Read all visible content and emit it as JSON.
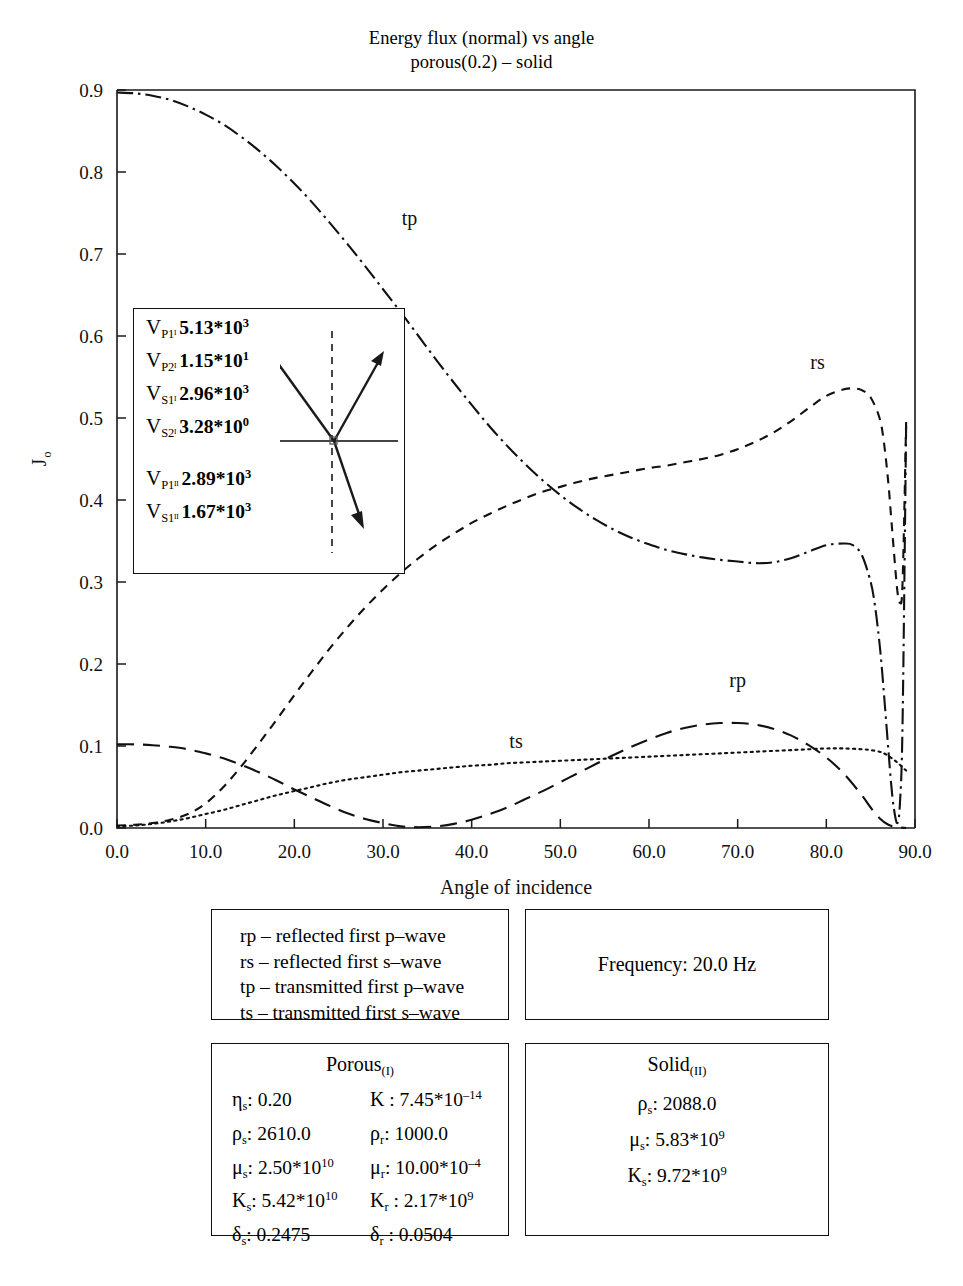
{
  "title": {
    "line1": "Energy flux (normal) vs angle",
    "line2": "porous(0.2) – solid"
  },
  "chart_data": {
    "type": "line",
    "xlabel": "Angle of incidence",
    "ylabel": "J",
    "ylabel_sub": "o",
    "xlim": [
      0.0,
      90.0
    ],
    "ylim": [
      0.0,
      0.9
    ],
    "xticks": [
      "0.0",
      "10.0",
      "20.0",
      "30.0",
      "40.0",
      "50.0",
      "60.0",
      "70.0",
      "80.0",
      "90.0"
    ],
    "xtick_values": [
      0,
      10,
      20,
      30,
      40,
      50,
      60,
      70,
      80,
      90
    ],
    "yticks": [
      "0.0",
      "0.1",
      "0.2",
      "0.3",
      "0.4",
      "0.5",
      "0.6",
      "0.7",
      "0.8",
      "0.9"
    ],
    "ytick_values": [
      0.0,
      0.1,
      0.2,
      0.3,
      0.4,
      0.5,
      0.6,
      0.7,
      0.8,
      0.9
    ],
    "grid": false,
    "legend_position": "inline-annotations",
    "series": [
      {
        "name": "tp",
        "style": "dash-dot",
        "label_x": 33.0,
        "label_y": 0.735,
        "x": [
          0,
          2,
          4,
          6,
          8,
          10,
          12,
          14,
          16,
          18,
          20,
          22,
          24,
          26,
          28,
          30,
          32,
          34,
          36,
          38,
          40,
          42,
          44,
          46,
          48,
          50,
          52,
          54,
          56,
          58,
          60,
          62,
          64,
          66,
          68,
          70,
          72,
          74,
          76,
          78,
          80,
          82,
          83,
          84,
          85,
          85.5,
          86,
          86.3,
          86.6,
          87,
          87.3,
          87.6,
          88,
          88.3,
          88.6,
          89
        ],
        "y": [
          0.897,
          0.896,
          0.893,
          0.888,
          0.88,
          0.87,
          0.858,
          0.843,
          0.826,
          0.807,
          0.786,
          0.763,
          0.738,
          0.712,
          0.685,
          0.657,
          0.629,
          0.6,
          0.571,
          0.543,
          0.516,
          0.49,
          0.466,
          0.444,
          0.424,
          0.406,
          0.39,
          0.376,
          0.364,
          0.354,
          0.346,
          0.339,
          0.334,
          0.33,
          0.327,
          0.325,
          0.323,
          0.324,
          0.329,
          0.337,
          0.345,
          0.347,
          0.345,
          0.333,
          0.3,
          0.27,
          0.225,
          0.19,
          0.15,
          0.095,
          0.055,
          0.025,
          0.006,
          0.03,
          0.13,
          0.49
        ]
      },
      {
        "name": "rs",
        "style": "dashed",
        "label_x": 79.0,
        "label_y": 0.56,
        "x": [
          0,
          2,
          4,
          6,
          8,
          10,
          12,
          14,
          16,
          18,
          20,
          22,
          24,
          26,
          28,
          30,
          32,
          34,
          36,
          38,
          40,
          42,
          44,
          46,
          48,
          50,
          52,
          54,
          56,
          58,
          60,
          62,
          64,
          66,
          68,
          70,
          72,
          74,
          76,
          78,
          80,
          82,
          83,
          84,
          85,
          86,
          86.5,
          87,
          87.3,
          87.6,
          88,
          88.3,
          88.6,
          89
        ],
        "y": [
          0.003,
          0.004,
          0.006,
          0.01,
          0.017,
          0.03,
          0.05,
          0.075,
          0.103,
          0.132,
          0.162,
          0.191,
          0.219,
          0.245,
          0.269,
          0.291,
          0.311,
          0.329,
          0.345,
          0.359,
          0.372,
          0.383,
          0.393,
          0.402,
          0.41,
          0.416,
          0.422,
          0.427,
          0.431,
          0.435,
          0.439,
          0.442,
          0.446,
          0.45,
          0.455,
          0.462,
          0.471,
          0.482,
          0.496,
          0.512,
          0.527,
          0.535,
          0.536,
          0.534,
          0.525,
          0.5,
          0.47,
          0.42,
          0.38,
          0.34,
          0.29,
          0.275,
          0.3,
          0.495
        ]
      },
      {
        "name": "rp",
        "style": "long-dash",
        "label_x": 70.0,
        "label_y": 0.172,
        "x": [
          0,
          2,
          4,
          6,
          8,
          10,
          12,
          14,
          16,
          18,
          20,
          22,
          24,
          26,
          28,
          30,
          32,
          34,
          36,
          38,
          40,
          42,
          44,
          46,
          48,
          50,
          52,
          54,
          56,
          58,
          60,
          62,
          64,
          66,
          68,
          70,
          72,
          74,
          76,
          78,
          80,
          82,
          84,
          85,
          86,
          87,
          88,
          89
        ],
        "y": [
          0.102,
          0.102,
          0.101,
          0.099,
          0.096,
          0.091,
          0.085,
          0.077,
          0.068,
          0.058,
          0.047,
          0.037,
          0.027,
          0.018,
          0.011,
          0.006,
          0.002,
          0.001,
          0.002,
          0.005,
          0.01,
          0.017,
          0.025,
          0.035,
          0.045,
          0.056,
          0.067,
          0.078,
          0.089,
          0.099,
          0.108,
          0.116,
          0.122,
          0.126,
          0.128,
          0.128,
          0.126,
          0.121,
          0.113,
          0.101,
          0.086,
          0.066,
          0.04,
          0.025,
          0.012,
          0.004,
          0.001,
          0.0
        ]
      },
      {
        "name": "ts",
        "style": "dotted",
        "label_x": 45.0,
        "label_y": 0.097,
        "x": [
          0,
          2,
          4,
          6,
          8,
          10,
          12,
          14,
          16,
          18,
          20,
          22,
          24,
          26,
          28,
          30,
          32,
          34,
          36,
          38,
          40,
          42,
          44,
          46,
          48,
          50,
          52,
          54,
          56,
          58,
          60,
          62,
          64,
          66,
          68,
          70,
          72,
          74,
          76,
          78,
          80,
          82,
          84,
          85,
          86,
          86.5,
          87,
          87.5,
          88,
          88.5,
          89
        ],
        "y": [
          0.002,
          0.003,
          0.005,
          0.008,
          0.012,
          0.017,
          0.022,
          0.028,
          0.034,
          0.04,
          0.045,
          0.05,
          0.055,
          0.059,
          0.062,
          0.065,
          0.068,
          0.07,
          0.072,
          0.074,
          0.076,
          0.077,
          0.079,
          0.08,
          0.081,
          0.082,
          0.083,
          0.084,
          0.085,
          0.086,
          0.087,
          0.088,
          0.089,
          0.09,
          0.091,
          0.092,
          0.093,
          0.094,
          0.095,
          0.096,
          0.097,
          0.097,
          0.096,
          0.095,
          0.093,
          0.091,
          0.088,
          0.084,
          0.08,
          0.075,
          0.07
        ]
      }
    ]
  },
  "inset": {
    "rows": [
      {
        "sym": "V",
        "sub": "P1ᴵ",
        "value": "5.13*10",
        "exp": "3",
        "gap": false
      },
      {
        "sym": "V",
        "sub": "P2ᴵ",
        "value": "1.15*10",
        "exp": "1",
        "gap": false
      },
      {
        "sym": "V",
        "sub": "S1ᴵ",
        "value": "2.96*10",
        "exp": "3",
        "gap": false
      },
      {
        "sym": "V",
        "sub": "S2ᴵ",
        "value": "3.28*10",
        "exp": "0",
        "gap": false
      },
      {
        "sym": "V",
        "sub": "P1ᴵᴵ",
        "value": "2.89*10",
        "exp": "3",
        "gap": true
      },
      {
        "sym": "V",
        "sub": "S1ᴵᴵ",
        "value": "1.67*10",
        "exp": "3",
        "gap": false
      }
    ]
  },
  "wave_legend": {
    "rows": [
      "rp – reflected first p–wave",
      "rs – reflected first s–wave",
      "tp – transmitted first p–wave",
      "ts – transmitted first s–wave"
    ]
  },
  "frequency": {
    "text": "Frequency: 20.0 Hz"
  },
  "porous": {
    "heading": "Porous",
    "heading_sub": "(I)",
    "params": [
      {
        "sym": "η",
        "sub": "s",
        "value": ": 0.20",
        "exp": ""
      },
      {
        "sym": "K",
        "sub": "",
        "value": " : 7.45*10",
        "exp": "–14"
      },
      {
        "sym": "ρ",
        "sub": "s",
        "value": ": 2610.0",
        "exp": ""
      },
      {
        "sym": "ρ",
        "sub": "r",
        "value": ": 1000.0",
        "exp": ""
      },
      {
        "sym": "μ",
        "sub": "s",
        "value": ": 2.50*10",
        "exp": "10"
      },
      {
        "sym": "μ",
        "sub": "r",
        "value": ": 10.00*10",
        "exp": "–4"
      },
      {
        "sym": "K",
        "sub": "s",
        "value": ": 5.42*10",
        "exp": "10"
      },
      {
        "sym": "K",
        "sub": "r",
        "value": " : 2.17*10",
        "exp": "9"
      },
      {
        "sym": "δ",
        "sub": "s",
        "value": ": 0.2475",
        "exp": ""
      },
      {
        "sym": "δ",
        "sub": "r",
        "value": " : 0.0504",
        "exp": ""
      }
    ]
  },
  "solid": {
    "heading": "Solid",
    "heading_sub": "(II)",
    "params": [
      {
        "sym": "ρ",
        "sub": "s",
        "value": ": 2088.0",
        "exp": ""
      },
      {
        "sym": "μ",
        "sub": "s",
        "value": ": 5.83*10",
        "exp": "9"
      },
      {
        "sym": "K",
        "sub": "s",
        "value": ": 9.72*10",
        "exp": "9"
      }
    ]
  }
}
